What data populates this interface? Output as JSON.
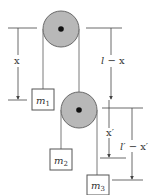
{
  "diagram": {
    "type": "double-pulley-system",
    "colors": {
      "pulley_fill": "#b8b8b8",
      "pulley_stroke": "#6a6a6a",
      "hub": "#111111",
      "rope": "#7a7a7a",
      "line": "#444444",
      "box_stroke": "#555555",
      "text": "#333333"
    },
    "masses": {
      "m1": {
        "label": "m",
        "sub": "1"
      },
      "m2": {
        "label": "m",
        "sub": "2"
      },
      "m3": {
        "label": "m",
        "sub": "3"
      }
    },
    "dimensions": {
      "x": "x",
      "l_minus_x": {
        "l": "l",
        "rest": " − x"
      },
      "x_prime": "x′",
      "l_prime_minus_x_prime": {
        "l": "l′",
        "rest": " − x′"
      }
    },
    "pulleys": [
      {
        "name": "upper-pulley",
        "cx": 61,
        "cy": 29,
        "r": 18
      },
      {
        "name": "lower-pulley",
        "cx": 79,
        "cy": 110,
        "r": 18
      }
    ]
  }
}
